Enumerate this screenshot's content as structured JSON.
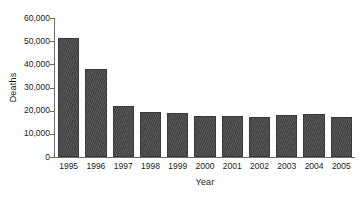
{
  "chart_data": {
    "type": "bar",
    "title": "",
    "subtitle": "",
    "xlabel": "Year",
    "ylabel": "Deaths",
    "categories": [
      "1995",
      "1996",
      "1997",
      "1998",
      "1999",
      "2000",
      "2001",
      "2002",
      "2003",
      "2004",
      "2005"
    ],
    "values": [
      51500,
      38000,
      22000,
      19500,
      19000,
      17800,
      17500,
      17400,
      18200,
      18500,
      17200
    ],
    "ylim": [
      0,
      60000
    ],
    "ytick_values": [
      0,
      10000,
      20000,
      30000,
      40000,
      50000,
      60000
    ],
    "ytick_labels": [
      "0",
      "10,000",
      "20,000",
      "30,000",
      "40,000",
      "50,000",
      "60,000"
    ],
    "grid": false,
    "legend": null,
    "legend_position": "none",
    "bar_color": "#4a4a4a",
    "bar_edge_color": "#3a3a3a",
    "axis_color": "#6b6b6b",
    "text_color": "#1a1a1a",
    "background_color": "#ffffff",
    "annotations": []
  }
}
